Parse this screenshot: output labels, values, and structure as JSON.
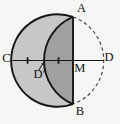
{
  "figure": {
    "points": {
      "A": {
        "label": "A",
        "x": 73,
        "y": 16.9
      },
      "B": {
        "label": "B",
        "x": 73,
        "y": 104.1
      },
      "C": {
        "label": "C",
        "x": 11.2,
        "y": 60.5
      },
      "D": {
        "label": "D",
        "x": 103.8,
        "y": 60.5
      },
      "M": {
        "label": "M",
        "x": 73,
        "y": 60.5
      },
      "Dprime": {
        "label": "D′",
        "x": 44,
        "y": 60.5
      }
    },
    "colors": {
      "background": "#f6f6f4",
      "crescent_fill": "#c7c7c7",
      "lens_fill": "#a0a0a0",
      "stroke": "#161616",
      "dashed_stroke": "#3c3c3c"
    },
    "styles": {
      "dash_pattern": "3.4,2.8"
    },
    "paths": {
      "crescent_fill": "M 73,16.9 A 46.3,46.3 0 1 0 73,104.1 A 47.3,47.3 0 0 1 73,16.9 Z",
      "lens_fill": "M 73,16.9 A 47.3,47.3 0 0 0 73,104.1 L 73,16.9 Z",
      "outer_left_arc": "M 73,16.9 A 46.3,46.3 0 1 0 73,104.1",
      "inner_arc": "M 73,16.9 A 47.3,47.3 0 0 0 73,104.1",
      "dashed_right_arc": "M 73,16.9 A 46.3,46.3 0 0 1 73,104.1",
      "line_CD": "M 11.2,60.5 L 103.8,60.5",
      "chord_AB": "M 73,16.9 L 73,104.1",
      "tick_mid_CDprime": "M 27.6,57.3 L 27.6,63.7",
      "tick_mid_DprimeM": "M 58.5,57.3 L 58.5,63.7",
      "dprime_arrow_line": "M 38.6,70.2 L 42.4,64.6",
      "dprime_arrow_head": "M 44,62.2 L 43.6,65.5 L 41.1,63.9 Z"
    }
  }
}
